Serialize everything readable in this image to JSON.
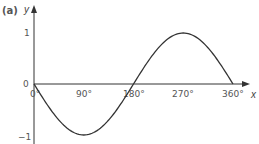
{
  "part_label": "(a)",
  "axes": {
    "x_label": "x",
    "y_label": "y",
    "origin_y_label": "0",
    "origin_x_label": "0°",
    "x_ticks": [
      "90°",
      "180°",
      "270°",
      "360°"
    ],
    "y_ticks": [
      "1",
      "−1"
    ]
  },
  "colors": {
    "curve": "#333333",
    "axes": "#333333",
    "text": "#555555"
  },
  "chart_data": {
    "type": "line",
    "title": "",
    "xlabel": "x",
    "ylabel": "y",
    "function": "y = -sin(x)",
    "x": [
      0,
      45,
      90,
      135,
      180,
      225,
      270,
      315,
      360
    ],
    "series": [
      {
        "name": "y = -sin x",
        "values": [
          0,
          -0.71,
          -1,
          -0.71,
          0,
          0.71,
          1,
          0.71,
          0
        ]
      }
    ],
    "x_tick_labels": [
      "0°",
      "90°",
      "180°",
      "270°",
      "360°"
    ],
    "y_tick_labels": [
      "-1",
      "0",
      "1"
    ],
    "xlim": [
      0,
      360
    ],
    "ylim": [
      -1,
      1
    ],
    "grid": false,
    "legend": "none"
  }
}
